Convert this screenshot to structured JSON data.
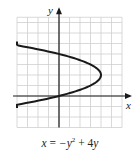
{
  "chart_data": {
    "type": "line",
    "title": "",
    "equation": "x = −y² + 4y",
    "xlabel": "x",
    "ylabel": "y",
    "xlim": [
      -4,
      6
    ],
    "ylim": [
      -3,
      7.5
    ],
    "grid": true,
    "grid_step": 1,
    "series": [
      {
        "name": "x = -y^2 + 4y",
        "points": [
          {
            "x": -5,
            "y": -1
          },
          {
            "x": 0,
            "y": 0
          },
          {
            "x": 3,
            "y": 1
          },
          {
            "x": 4,
            "y": 2
          },
          {
            "x": 3,
            "y": 3
          },
          {
            "x": 0,
            "y": 4
          },
          {
            "x": -5,
            "y": 5
          }
        ]
      }
    ],
    "vertex": {
      "x": 4,
      "y": 2
    }
  },
  "caption": {
    "lhs": "x",
    "eq": " = ",
    "term1": "−y",
    "exp": "2",
    "plus": " + ",
    "coef": "4",
    "term2": "y"
  },
  "colors": {
    "curve": "#1a1a1a",
    "axes": "#1a1a1a",
    "grid": "#cfcfcf"
  }
}
